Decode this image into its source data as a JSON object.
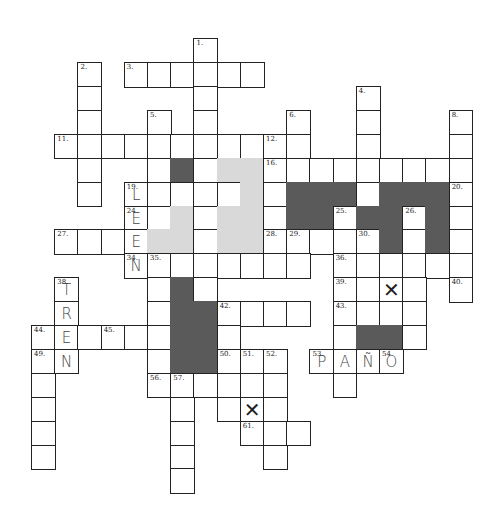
{
  "puzzle": {
    "title": "",
    "grid_origin": {
      "x": 55,
      "y": 39
    },
    "cell_size": {
      "w": 23.2,
      "h": 23.9
    },
    "colors": {
      "border": "#222222",
      "dark_block": "#5a5a5a",
      "light_block": "#d9d9d9",
      "handwriting": "#444444"
    },
    "cells": [
      {
        "r": 0,
        "c": 6,
        "n": "1."
      },
      {
        "r": 1,
        "c": 1,
        "n": "2."
      },
      {
        "r": 1,
        "c": 3,
        "n": "3."
      },
      {
        "r": 1,
        "c": 4
      },
      {
        "r": 1,
        "c": 5
      },
      {
        "r": 1,
        "c": 6
      },
      {
        "r": 1,
        "c": 7
      },
      {
        "r": 1,
        "c": 8
      },
      {
        "r": 2,
        "c": 1
      },
      {
        "r": 2,
        "c": 6
      },
      {
        "r": 2,
        "c": 13,
        "n": "4."
      },
      {
        "r": 3,
        "c": 1
      },
      {
        "r": 3,
        "c": 4,
        "n": "5."
      },
      {
        "r": 3,
        "c": 6
      },
      {
        "r": 3,
        "c": 10,
        "n": "6."
      },
      {
        "r": 3,
        "c": 13
      },
      {
        "r": 3,
        "c": 17,
        "n": "8."
      },
      {
        "r": 4,
        "c": 0,
        "n": "11."
      },
      {
        "r": 4,
        "c": 1
      },
      {
        "r": 4,
        "c": 2
      },
      {
        "r": 4,
        "c": 3
      },
      {
        "r": 4,
        "c": 4
      },
      {
        "r": 4,
        "c": 5
      },
      {
        "r": 4,
        "c": 6
      },
      {
        "r": 4,
        "c": 7
      },
      {
        "r": 4,
        "c": 8
      },
      {
        "r": 4,
        "c": 9,
        "n": "12."
      },
      {
        "r": 4,
        "c": 10
      },
      {
        "r": 4,
        "c": 13
      },
      {
        "r": 4,
        "c": 17
      },
      {
        "r": 5,
        "c": 1
      },
      {
        "r": 5,
        "c": 4
      },
      {
        "r": 5,
        "c": 5,
        "t": "dark"
      },
      {
        "r": 5,
        "c": 6
      },
      {
        "r": 5,
        "c": 7,
        "t": "light"
      },
      {
        "r": 5,
        "c": 8,
        "t": "light"
      },
      {
        "r": 5,
        "c": 9,
        "n": "16."
      },
      {
        "r": 5,
        "c": 10
      },
      {
        "r": 5,
        "c": 11
      },
      {
        "r": 5,
        "c": 12
      },
      {
        "r": 5,
        "c": 13
      },
      {
        "r": 5,
        "c": 14
      },
      {
        "r": 5,
        "c": 15
      },
      {
        "r": 5,
        "c": 16
      },
      {
        "r": 5,
        "c": 17
      },
      {
        "r": 6,
        "c": 1
      },
      {
        "r": 6,
        "c": 3,
        "n": "19.",
        "l": "L"
      },
      {
        "r": 6,
        "c": 4
      },
      {
        "r": 6,
        "c": 5
      },
      {
        "r": 6,
        "c": 6
      },
      {
        "r": 6,
        "c": 7
      },
      {
        "r": 6,
        "c": 8,
        "t": "light"
      },
      {
        "r": 6,
        "c": 9
      },
      {
        "r": 6,
        "c": 10,
        "t": "dark"
      },
      {
        "r": 6,
        "c": 11,
        "t": "dark"
      },
      {
        "r": 6,
        "c": 12,
        "t": "dark"
      },
      {
        "r": 6,
        "c": 13
      },
      {
        "r": 6,
        "c": 14,
        "t": "dark"
      },
      {
        "r": 6,
        "c": 15,
        "t": "dark"
      },
      {
        "r": 6,
        "c": 16,
        "t": "dark"
      },
      {
        "r": 6,
        "c": 17,
        "n": "20."
      },
      {
        "r": 7,
        "c": 3,
        "n": "24.",
        "l": "E"
      },
      {
        "r": 7,
        "c": 4
      },
      {
        "r": 7,
        "c": 5,
        "t": "light"
      },
      {
        "r": 7,
        "c": 6
      },
      {
        "r": 7,
        "c": 7,
        "t": "light"
      },
      {
        "r": 7,
        "c": 8,
        "t": "light"
      },
      {
        "r": 7,
        "c": 9
      },
      {
        "r": 7,
        "c": 10,
        "t": "dark"
      },
      {
        "r": 7,
        "c": 11,
        "t": "dark"
      },
      {
        "r": 7,
        "c": 12,
        "n": "25."
      },
      {
        "r": 7,
        "c": 13,
        "t": "dark"
      },
      {
        "r": 7,
        "c": 14,
        "t": "dark"
      },
      {
        "r": 7,
        "c": 15,
        "n": "26."
      },
      {
        "r": 7,
        "c": 16,
        "t": "dark"
      },
      {
        "r": 7,
        "c": 17
      },
      {
        "r": 8,
        "c": 0,
        "n": "27."
      },
      {
        "r": 8,
        "c": 1
      },
      {
        "r": 8,
        "c": 2
      },
      {
        "r": 8,
        "c": 3,
        "l": "E"
      },
      {
        "r": 8,
        "c": 4,
        "t": "light"
      },
      {
        "r": 8,
        "c": 5,
        "t": "light"
      },
      {
        "r": 8,
        "c": 6
      },
      {
        "r": 8,
        "c": 7,
        "t": "light"
      },
      {
        "r": 8,
        "c": 8,
        "t": "light"
      },
      {
        "r": 8,
        "c": 9,
        "n": "28."
      },
      {
        "r": 8,
        "c": 10,
        "n": "29."
      },
      {
        "r": 8,
        "c": 11
      },
      {
        "r": 8,
        "c": 12
      },
      {
        "r": 8,
        "c": 13,
        "n": "30."
      },
      {
        "r": 8,
        "c": 14,
        "t": "dark"
      },
      {
        "r": 8,
        "c": 15
      },
      {
        "r": 8,
        "c": 16,
        "t": "dark"
      },
      {
        "r": 8,
        "c": 17
      },
      {
        "r": 9,
        "c": 3,
        "n": "34.",
        "l": "N"
      },
      {
        "r": 9,
        "c": 4,
        "n": "35."
      },
      {
        "r": 9,
        "c": 5
      },
      {
        "r": 9,
        "c": 6
      },
      {
        "r": 9,
        "c": 7
      },
      {
        "r": 9,
        "c": 8
      },
      {
        "r": 9,
        "c": 9
      },
      {
        "r": 9,
        "c": 10
      },
      {
        "r": 9,
        "c": 12,
        "n": "36."
      },
      {
        "r": 9,
        "c": 13
      },
      {
        "r": 9,
        "c": 14
      },
      {
        "r": 9,
        "c": 15
      },
      {
        "r": 9,
        "c": 16
      },
      {
        "r": 9,
        "c": 17
      },
      {
        "r": 10,
        "c": 0,
        "n": "38.",
        "l": "T"
      },
      {
        "r": 10,
        "c": 4
      },
      {
        "r": 10,
        "c": 5,
        "t": "dark"
      },
      {
        "r": 10,
        "c": 6
      },
      {
        "r": 10,
        "c": 12,
        "n": "39."
      },
      {
        "r": 10,
        "c": 13
      },
      {
        "r": 10,
        "c": 14,
        "x": true
      },
      {
        "r": 10,
        "c": 15
      },
      {
        "r": 10,
        "c": 17,
        "n": "40."
      },
      {
        "r": 11,
        "c": 0,
        "l": "R"
      },
      {
        "r": 11,
        "c": 4
      },
      {
        "r": 11,
        "c": 5,
        "t": "dark"
      },
      {
        "r": 11,
        "c": 6,
        "t": "dark"
      },
      {
        "r": 11,
        "c": 7,
        "n": "42."
      },
      {
        "r": 11,
        "c": 8
      },
      {
        "r": 11,
        "c": 9
      },
      {
        "r": 11,
        "c": 10
      },
      {
        "r": 11,
        "c": 12,
        "n": "43."
      },
      {
        "r": 11,
        "c": 13
      },
      {
        "r": 11,
        "c": 14
      },
      {
        "r": 11,
        "c": 15
      },
      {
        "r": 12,
        "c": -1,
        "n": "44."
      },
      {
        "r": 12,
        "c": 0,
        "l": "E"
      },
      {
        "r": 12,
        "c": 1
      },
      {
        "r": 12,
        "c": 2,
        "n": "45."
      },
      {
        "r": 12,
        "c": 3
      },
      {
        "r": 12,
        "c": 4
      },
      {
        "r": 12,
        "c": 5,
        "t": "dark"
      },
      {
        "r": 12,
        "c": 6,
        "t": "dark"
      },
      {
        "r": 12,
        "c": 7
      },
      {
        "r": 12,
        "c": 12
      },
      {
        "r": 12,
        "c": 13,
        "t": "dark"
      },
      {
        "r": 12,
        "c": 14,
        "t": "dark"
      },
      {
        "r": 12,
        "c": 15
      },
      {
        "r": 13,
        "c": -1,
        "n": "49."
      },
      {
        "r": 13,
        "c": 0,
        "l": "N"
      },
      {
        "r": 13,
        "c": 4
      },
      {
        "r": 13,
        "c": 5,
        "t": "dark"
      },
      {
        "r": 13,
        "c": 6,
        "t": "dark"
      },
      {
        "r": 13,
        "c": 7,
        "n": "50."
      },
      {
        "r": 13,
        "c": 8,
        "n": "51."
      },
      {
        "r": 13,
        "c": 9,
        "n": "52."
      },
      {
        "r": 13,
        "c": 11,
        "n": "53.",
        "l": "P"
      },
      {
        "r": 13,
        "c": 12,
        "l": "A"
      },
      {
        "r": 13,
        "c": 13,
        "l": "Ñ"
      },
      {
        "r": 13,
        "c": 14,
        "n": "54.",
        "l": "O"
      },
      {
        "r": 14,
        "c": -1
      },
      {
        "r": 14,
        "c": 4,
        "n": "56."
      },
      {
        "r": 14,
        "c": 5,
        "n": "57."
      },
      {
        "r": 14,
        "c": 6
      },
      {
        "r": 14,
        "c": 7
      },
      {
        "r": 14,
        "c": 8
      },
      {
        "r": 14,
        "c": 9
      },
      {
        "r": 14,
        "c": 12
      },
      {
        "r": 15,
        "c": -1
      },
      {
        "r": 15,
        "c": 5
      },
      {
        "r": 15,
        "c": 7
      },
      {
        "r": 15,
        "c": 8,
        "x": true
      },
      {
        "r": 15,
        "c": 9
      },
      {
        "r": 16,
        "c": -1
      },
      {
        "r": 16,
        "c": 5
      },
      {
        "r": 16,
        "c": 8,
        "n": "61."
      },
      {
        "r": 16,
        "c": 9
      },
      {
        "r": 16,
        "c": 10
      },
      {
        "r": 17,
        "c": -1
      },
      {
        "r": 17,
        "c": 5
      },
      {
        "r": 17,
        "c": 9
      },
      {
        "r": 18,
        "c": 5
      }
    ],
    "handwritten_words": [
      "LEEN",
      "TREN",
      "PAÑO"
    ],
    "crossed_cells_mark": "✕"
  }
}
